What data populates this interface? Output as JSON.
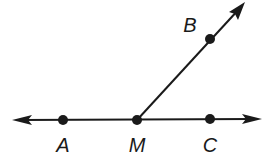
{
  "diagram": {
    "type": "geometry-angle",
    "line": {
      "from": [
        12,
        120
      ],
      "to": [
        262,
        119
      ],
      "arrows": "both"
    },
    "ray": {
      "from": [
        137,
        120
      ],
      "to": [
        244,
        3
      ],
      "arrow": "end"
    },
    "points": [
      {
        "label": "A",
        "x": 63,
        "y": 120,
        "lx": 63,
        "ly": 152
      },
      {
        "label": "M",
        "x": 137,
        "y": 120,
        "lx": 137,
        "ly": 152
      },
      {
        "label": "C",
        "x": 210,
        "y": 119,
        "lx": 210,
        "ly": 152
      },
      {
        "label": "B",
        "x": 210,
        "y": 39,
        "lx": 190,
        "ly": 32
      }
    ],
    "colors": {
      "stroke": "#1a1a1a",
      "background": "#ffffff"
    }
  }
}
